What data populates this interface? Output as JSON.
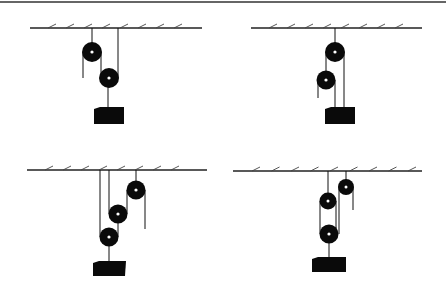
{
  "figure": {
    "colors": {
      "ink": "#0a0a0a",
      "background": "#ffffff"
    },
    "panels": [
      {
        "id": "A",
        "position": "top-left",
        "pulley_count": 2,
        "label": ""
      },
      {
        "id": "B",
        "position": "top-right",
        "pulley_count": 2,
        "label": ""
      },
      {
        "id": "C",
        "position": "bottom-left",
        "pulley_count": 3,
        "label": ""
      },
      {
        "id": "D",
        "position": "bottom-right",
        "pulley_count": 3,
        "label": ""
      }
    ]
  }
}
